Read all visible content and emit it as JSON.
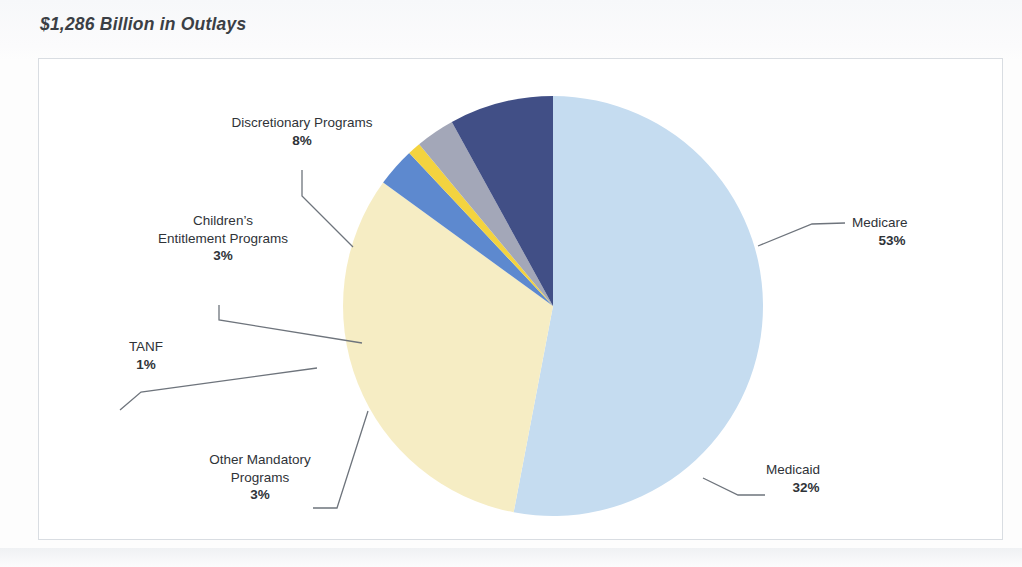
{
  "title": "$1,286 Billion in Outlays",
  "chart_data": {
    "type": "pie",
    "title": "$1,286 Billion in Outlays",
    "total_label": "$1,286 Billion in Outlays",
    "units": "percent of outlays",
    "legend": "none (direct labels with leader lines)",
    "grid": false,
    "categories": [
      "Medicare",
      "Medicaid",
      "Other Mandatory Programs",
      "TANF",
      "Children’s Entitlement Programs",
      "Discretionary Programs"
    ],
    "values": [
      53,
      32,
      3,
      1,
      3,
      8
    ],
    "labels": [
      "Medicare",
      "Medicaid",
      "Other Mandatory Programs",
      "TANF",
      "Children’s Entitlement Programs",
      "Discretionary Programs"
    ],
    "value_labels": [
      "53%",
      "32%",
      "3%",
      "1%",
      "3%",
      "8%"
    ],
    "colors": [
      "#c5dcf0",
      "#f6edc4",
      "#5d89cf",
      "#f3d33f",
      "#a3a7b8",
      "#414f86"
    ],
    "start_angle_deg": 0,
    "direction": "clockwise"
  },
  "slices": [
    {
      "name": "Medicare",
      "pct": "53%",
      "value": 53,
      "color": "#c5dcf0"
    },
    {
      "name": "Medicaid",
      "pct": "32%",
      "value": 32,
      "color": "#f6edc4"
    },
    {
      "name": "Other Mandatory Programs",
      "pct": "3%",
      "value": 3,
      "color": "#5d89cf"
    },
    {
      "name": "TANF",
      "pct": "1%",
      "value": 1,
      "color": "#f3d33f"
    },
    {
      "name": "Children’s Entitlement Programs",
      "pct": "3%",
      "value": 3,
      "color": "#a3a7b8"
    },
    {
      "name": "Discretionary Programs",
      "pct": "8%",
      "value": 8,
      "color": "#414f86"
    }
  ],
  "labels": {
    "discretionary": {
      "line1": "Discretionary Programs",
      "pct": "8%"
    },
    "children": {
      "line1": "Children’s",
      "line2": "Entitlement Programs",
      "pct": "3%"
    },
    "tanf": {
      "line1": "TANF",
      "pct": "1%"
    },
    "other_mandatory": {
      "line1": "Other Mandatory",
      "line2": "Programs",
      "pct": "3%"
    },
    "medicare": {
      "line1": "Medicare",
      "pct": "53%"
    },
    "medicaid": {
      "line1": "Medicaid",
      "pct": "32%"
    }
  }
}
